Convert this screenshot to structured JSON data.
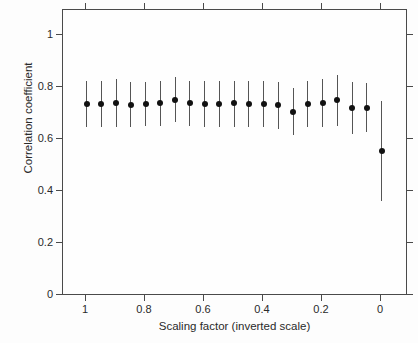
{
  "chart_data": {
    "type": "scatter",
    "title": "",
    "xlabel": "Scaling factor (inverted scale)",
    "ylabel": "Correlation coefficient",
    "xlim": [
      1.05,
      -0.05
    ],
    "ylim": [
      0,
      1.1
    ],
    "inverted_x_axis": true,
    "grid": false,
    "legend": null,
    "xticks": [
      "1",
      "0.8",
      "0.6",
      "0.4",
      "0.2",
      "0"
    ],
    "xtick_values": [
      1,
      0.8,
      0.6,
      0.4,
      0.2,
      0
    ],
    "yticks": [
      "0",
      "0.2",
      "0.4",
      "0.6",
      "0.8",
      "1"
    ],
    "ytick_values": [
      0,
      0.2,
      0.4,
      0.6,
      0.8,
      1
    ],
    "marker_color": "#111111",
    "errorbar_color": "#555555",
    "frame_color": "#4a4a4a",
    "series": [
      {
        "name": "Correlation coefficient",
        "x": [
          1.0,
          0.95,
          0.9,
          0.85,
          0.8,
          0.75,
          0.7,
          0.65,
          0.6,
          0.55,
          0.5,
          0.45,
          0.4,
          0.35,
          0.3,
          0.25,
          0.2,
          0.15,
          0.1,
          0.05,
          0.0
        ],
        "values": [
          0.735,
          0.735,
          0.74,
          0.73,
          0.735,
          0.74,
          0.75,
          0.74,
          0.735,
          0.735,
          0.74,
          0.735,
          0.735,
          0.73,
          0.705,
          0.735,
          0.74,
          0.75,
          0.72,
          0.72,
          0.555
        ],
        "err_low": [
          0.645,
          0.645,
          0.645,
          0.645,
          0.65,
          0.65,
          0.665,
          0.65,
          0.645,
          0.645,
          0.645,
          0.645,
          0.645,
          0.64,
          0.615,
          0.645,
          0.645,
          0.65,
          0.62,
          0.625,
          0.36
        ],
        "err_high": [
          0.825,
          0.825,
          0.83,
          0.82,
          0.82,
          0.825,
          0.84,
          0.825,
          0.825,
          0.825,
          0.825,
          0.825,
          0.825,
          0.82,
          0.795,
          0.825,
          0.83,
          0.845,
          0.82,
          0.815,
          0.745
        ]
      }
    ]
  }
}
